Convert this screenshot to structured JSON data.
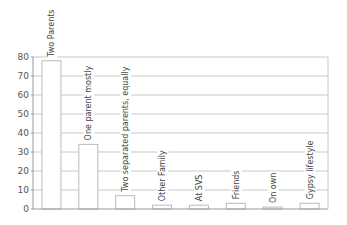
{
  "chart_data": {
    "type": "bar",
    "title": "",
    "xlabel": "",
    "ylabel": "",
    "ylim": [
      0,
      80
    ],
    "yticks": [
      0,
      10,
      20,
      30,
      40,
      50,
      60,
      70,
      80
    ],
    "grid": true,
    "legend": "none",
    "categories": [
      "Two Parents",
      "One parent mostly",
      "Two separated parents, equally",
      "Other Family",
      "At SVS",
      "Friends",
      "On own",
      "Gypsy lifestyle"
    ],
    "values": [
      78,
      34,
      7,
      2,
      2,
      3,
      1,
      3
    ],
    "colors": {
      "bar_fill": "#ffffff",
      "bar_stroke": "#bbbbbb",
      "grid": "#c8c8c8",
      "axis": "#999999",
      "text": "#555555"
    }
  }
}
